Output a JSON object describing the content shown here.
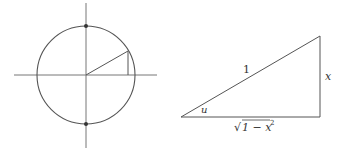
{
  "figure": {
    "colors": {
      "stroke": "#555555",
      "axis": "#777777",
      "text": "#333333"
    },
    "unit_circle": {
      "center": [
        86,
        75
      ],
      "radius": 49,
      "axes": {
        "x_range": [
          14,
          157
        ],
        "y_range": [
          3,
          148
        ]
      },
      "marked_points": [
        [
          86,
          26
        ],
        [
          86,
          124
        ]
      ],
      "radius_point": [
        127,
        52
      ]
    },
    "triangle": {
      "vertices": {
        "left": [
          181,
          117
        ],
        "bottom_right": [
          320,
          117
        ],
        "top_right": [
          320,
          36
        ]
      },
      "labels": {
        "hypotenuse": "1",
        "opposite": "x",
        "angle": "u",
        "adjacent": "√1 − x²",
        "adjacent_base": "1 − x",
        "adjacent_exp": "2"
      }
    }
  }
}
